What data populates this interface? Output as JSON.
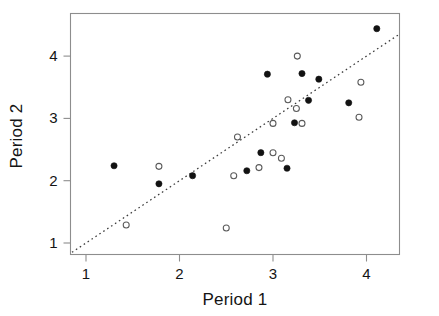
{
  "chart_data": {
    "type": "scatter",
    "title": "",
    "xlabel": "Period 1",
    "ylabel": "Period 2",
    "xlim": [
      0.83,
      4.36
    ],
    "ylim": [
      0.8,
      4.62
    ],
    "xticks": [
      1,
      2,
      3,
      4
    ],
    "yticks": [
      1,
      2,
      3,
      4
    ],
    "xtick_labels": [
      "1",
      "2",
      "3",
      "4"
    ],
    "ytick_labels": [
      "1",
      "2",
      "3",
      "4"
    ],
    "grid": false,
    "legend": null,
    "annotations": [
      {
        "name": "identity-line",
        "description": "dotted line of equality y = x",
        "style": "dotted",
        "from": [
          0.85,
          0.85
        ],
        "to": [
          4.36,
          4.36
        ]
      }
    ],
    "series": [
      {
        "name": "filled",
        "marker": "filled-circle",
        "color": "#121212",
        "points": [
          [
            1.3,
            2.24
          ],
          [
            1.78,
            1.95
          ],
          [
            2.14,
            2.08
          ],
          [
            2.72,
            2.16
          ],
          [
            2.87,
            2.45
          ],
          [
            2.94,
            3.71
          ],
          [
            3.15,
            2.2
          ],
          [
            3.23,
            2.93
          ],
          [
            3.31,
            3.72
          ],
          [
            3.38,
            3.29
          ],
          [
            3.49,
            3.63
          ],
          [
            3.81,
            3.25
          ],
          [
            4.11,
            4.44
          ]
        ]
      },
      {
        "name": "open",
        "marker": "open-circle",
        "color": "#5a5a5a",
        "points": [
          [
            1.43,
            1.29
          ],
          [
            1.78,
            2.23
          ],
          [
            2.5,
            1.24
          ],
          [
            2.58,
            2.08
          ],
          [
            2.62,
            2.7
          ],
          [
            2.85,
            2.21
          ],
          [
            3.0,
            2.45
          ],
          [
            3.0,
            2.92
          ],
          [
            3.09,
            2.36
          ],
          [
            3.16,
            3.3
          ],
          [
            3.25,
            3.16
          ],
          [
            3.26,
            4.0
          ],
          [
            3.31,
            2.92
          ],
          [
            3.92,
            3.02
          ],
          [
            3.94,
            3.58
          ]
        ]
      }
    ]
  },
  "axes": {
    "x_title": "Period 1",
    "y_title": "Period 2"
  }
}
